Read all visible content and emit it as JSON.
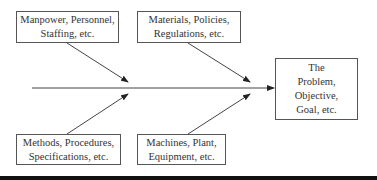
{
  "diagram": {
    "type": "fishbone",
    "colors": {
      "line": "#444444",
      "box_border": "#555555",
      "text": "#333333",
      "rule": "#111111"
    },
    "causes": [
      {
        "id": "cause-1",
        "position": "top-left",
        "text": "Manpower, Personnel,\nStaffing, etc."
      },
      {
        "id": "cause-2",
        "position": "top-right",
        "text": "Materials, Policies,\nRegulations, etc."
      },
      {
        "id": "cause-3",
        "position": "bottom-left",
        "text": "Methods, Procedures,\nSpecifications, etc."
      },
      {
        "id": "cause-4",
        "position": "bottom-right",
        "text": "Machines, Plant,\nEquipment, etc."
      }
    ],
    "effect": {
      "text": "The\nProblem,\nObjective,\nGoal, etc."
    }
  }
}
